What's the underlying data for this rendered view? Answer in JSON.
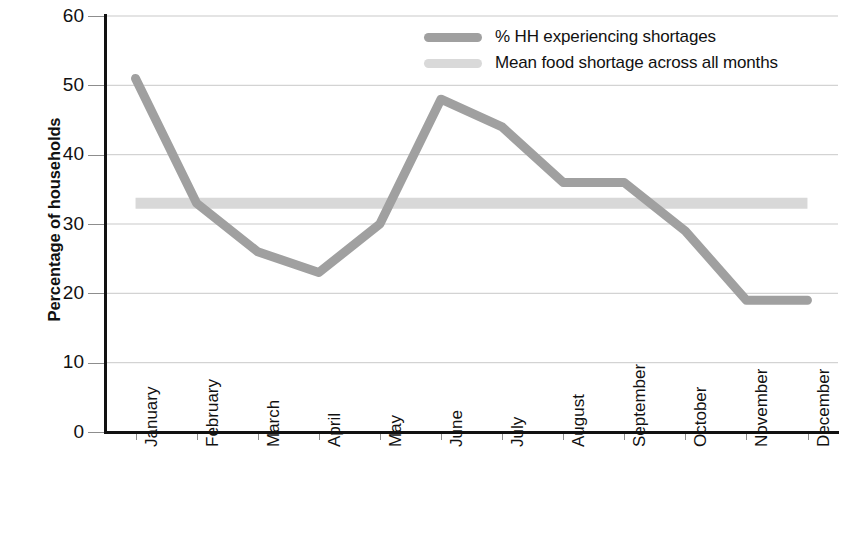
{
  "chart_data": {
    "type": "line",
    "title": "",
    "xlabel": "",
    "ylabel": "Percentage of households",
    "ylim": [
      0,
      60
    ],
    "yticks": [
      0,
      10,
      20,
      30,
      40,
      50,
      60
    ],
    "grid": true,
    "legend_position": "top-center",
    "categories": [
      "January",
      "February",
      "March",
      "April",
      "May",
      "June",
      "July",
      "August",
      "September",
      "October",
      "November",
      "December"
    ],
    "series": [
      {
        "name": "% HH experiencing shortages",
        "color": "#a0a0a0",
        "style": "line",
        "values": [
          51,
          33,
          26,
          23,
          30,
          48,
          44,
          36,
          36,
          29,
          19,
          19
        ]
      },
      {
        "name": "Mean food shortage across all months",
        "color": "#d8d8d8",
        "style": "constant-line",
        "value": 33,
        "values": [
          33,
          33,
          33,
          33,
          33,
          33,
          33,
          33,
          33,
          33,
          33,
          33
        ]
      }
    ]
  },
  "axes": {
    "y_title": "Percentage of households",
    "y_tick_labels": [
      "60",
      "50",
      "40",
      "30",
      "20",
      "10",
      "0"
    ],
    "x_tick_labels": [
      "January",
      "February",
      "March",
      "April",
      "May",
      "June",
      "July",
      "August",
      "September",
      "October",
      "November",
      "December"
    ]
  },
  "legend": {
    "entries": [
      {
        "label": "% HH experiencing shortages",
        "color": "#a0a0a0"
      },
      {
        "label": "Mean food shortage across all months",
        "color": "#d9d9d9"
      }
    ]
  },
  "colors": {
    "series_line": "#a0a0a0",
    "mean_line": "#d9d9d9",
    "gridline": "#c8c8c8",
    "axis": "#111111",
    "text": "#111111",
    "background": "#ffffff"
  }
}
